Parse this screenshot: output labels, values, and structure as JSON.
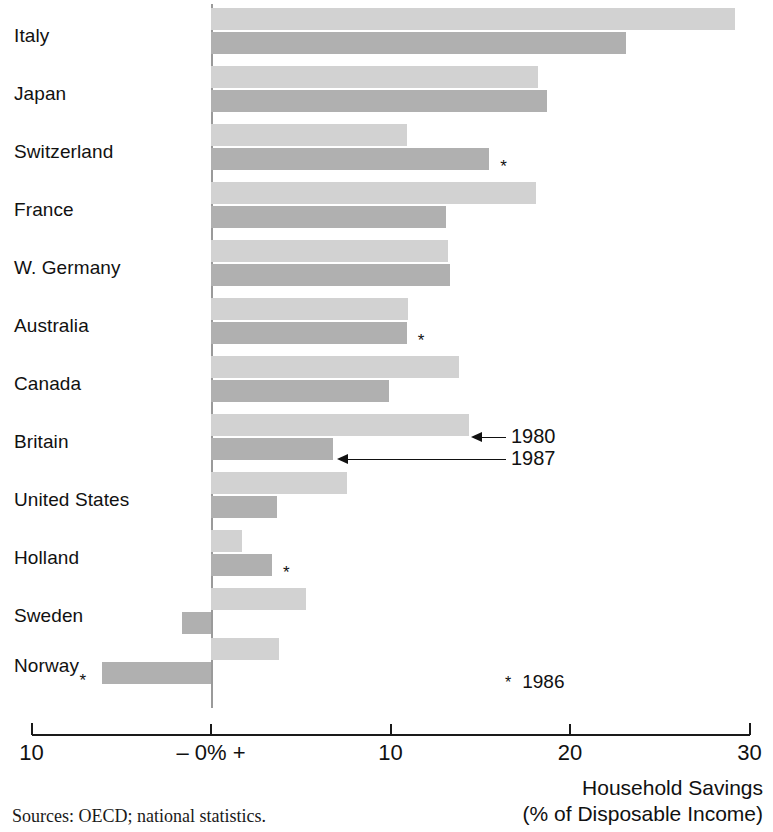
{
  "chart_data": {
    "type": "bar",
    "orientation": "horizontal",
    "title": "",
    "xlabel": "Household Savings (% of Disposable Income)",
    "ylabel": "",
    "xlim": [
      -10,
      30
    ],
    "xticks": [
      -10,
      0,
      10,
      20,
      30
    ],
    "xtick_labels": [
      "10",
      "– 0% +",
      "10",
      "20",
      "30"
    ],
    "grid": false,
    "legend_position": "inline-callout",
    "categories": [
      "Italy",
      "Japan",
      "Switzerland",
      "France",
      "W. Germany",
      "Australia",
      "Canada",
      "Britain",
      "United States",
      "Holland",
      "Sweden",
      "Norway"
    ],
    "series": [
      {
        "name": "1980",
        "color": "#d2d2d2",
        "values": [
          29.2,
          18.2,
          10.9,
          18.1,
          13.2,
          11.0,
          13.8,
          14.4,
          7.6,
          1.7,
          5.3,
          3.8
        ]
      },
      {
        "name": "1987",
        "color": "#b0b0b0",
        "values": [
          23.1,
          18.7,
          15.5,
          13.1,
          13.3,
          10.9,
          9.9,
          6.8,
          3.7,
          3.4,
          -1.6,
          -6.1
        ]
      }
    ],
    "footnote_marker": "*",
    "footnote_text": "1986",
    "footnote_applies_to": [
      {
        "category": "Switzerland",
        "series": "1987"
      },
      {
        "category": "Australia",
        "series": "1987"
      },
      {
        "category": "Holland",
        "series": "1987"
      },
      {
        "category": "Norway",
        "series": "1987"
      }
    ],
    "annotations": [
      {
        "label": "1980",
        "target_category": "Britain",
        "target_series": "1980"
      },
      {
        "label": "1987",
        "target_category": "Britain",
        "target_series": "1987"
      }
    ],
    "source": "Sources: OECD; national statistics."
  },
  "axis": {
    "title_line1": "Household Savings",
    "title_line2": "(% of Disposable Income)"
  },
  "source_note": "Sources: OECD; national statistics.",
  "footnote": {
    "star": "*",
    "year": "1986"
  },
  "callouts": {
    "a": "1980",
    "b": "1987"
  },
  "markers": {
    "star": "*"
  }
}
